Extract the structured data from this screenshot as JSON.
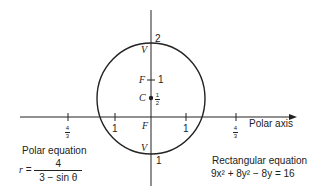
{
  "diagram": {
    "axis_label": "Polar axis",
    "vertical_ticks": {
      "top": "2",
      "bottom": "1",
      "focus_upper": "1"
    },
    "center_label": "C",
    "center_value": {
      "num": "1",
      "den": "2"
    },
    "focus_label_upper": "F",
    "focus_label_origin": "F",
    "vertex_label_top": "V",
    "vertex_label_bottom": "V",
    "x_ticks": [
      {
        "pos": "-4/3",
        "num": "4",
        "den": "3"
      },
      {
        "pos": "-1",
        "label": "1"
      },
      {
        "pos": "1",
        "label": "1"
      },
      {
        "pos": "4/3",
        "num": "4",
        "den": "3"
      }
    ],
    "polar_equation": {
      "title": "Polar equation",
      "lhs": "r",
      "equals": "=",
      "numerator": "4",
      "denominator": "3 − sin θ"
    },
    "rectangular_equation": {
      "title": "Rectangular equation",
      "expression": "9x² + 8y² − 8y = 16"
    },
    "colors": {
      "stroke": "#222222",
      "background": "#ffffff"
    }
  }
}
